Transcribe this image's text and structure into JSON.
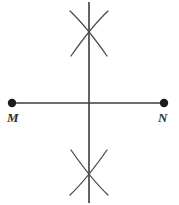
{
  "figure": {
    "kind": "geometry-construction",
    "width": 179,
    "height": 205,
    "background_color": "#ffffff",
    "stroke_color": "#3c3c3c",
    "label_color": "#2e2e2e",
    "line_width": 1.6,
    "arc_line_width": 1.3
  },
  "segment": {
    "name": "MN",
    "y": 103,
    "x_start": 12,
    "x_end": 165
  },
  "endpoints": [
    {
      "id": "M",
      "label": "M",
      "x": 12,
      "y": 103,
      "dot_radius": 4.2
    },
    {
      "id": "N",
      "label": "N",
      "x": 164,
      "y": 103,
      "dot_radius": 4.2
    }
  ],
  "bisector": {
    "name": "perpendicular-bisector",
    "x": 89,
    "y_top": 2,
    "y_bottom": 203
  },
  "arcs": [
    {
      "id": "upper-left-arc",
      "group": "upper",
      "path": "M 70 11 Q 86 26 107 56"
    },
    {
      "id": "upper-right-arc",
      "group": "upper",
      "path": "M 108 11 Q 92 26 71 56"
    },
    {
      "id": "lower-left-arc",
      "group": "lower",
      "path": "M 70 195 Q 86 180 107 150"
    },
    {
      "id": "lower-right-arc",
      "group": "lower",
      "path": "M 108 195 Q 92 180 71 150"
    }
  ],
  "arc_intersections": [
    {
      "id": "upper-arc-crossing",
      "x": 89,
      "y": 32
    },
    {
      "id": "lower-arc-crossing",
      "x": 89,
      "y": 174
    }
  ]
}
